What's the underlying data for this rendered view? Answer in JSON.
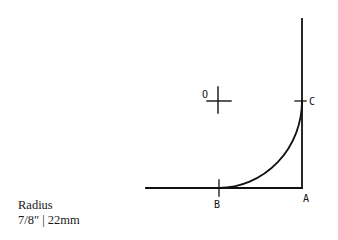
{
  "caption": {
    "title": "Radius",
    "measurement": "7/8\" | 22mm"
  },
  "labels": {
    "center": "O",
    "point_a": "A",
    "point_b": "B",
    "point_c": "C"
  },
  "colors": {
    "stroke": "#111111",
    "background": "#ffffff"
  }
}
